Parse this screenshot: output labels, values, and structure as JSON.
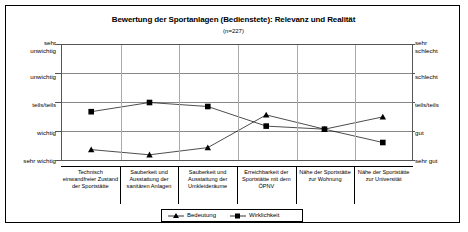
{
  "chart_data": {
    "type": "line",
    "title": "Bewertung der Sportanlagen (Bedienstete): Relevanz und Realität",
    "subtitle": "(n=227)",
    "categories": [
      "Technisch einwandfreier Zustand der Sportstätte",
      "Sauberkeit und Ausstattung der sanitären Anlagen",
      "Sauberkeit und Ausstattung der Umkleideräume",
      "Erreichbarkeit der Sportstätte mit dem ÖPNV",
      "Nähe der Sportstätte zur Wohnung",
      "Nähe der Sportstätte zur Universität"
    ],
    "categories_lines": [
      [
        "Technisch",
        "einwandfreier Zustand",
        "der Sportstätte"
      ],
      [
        "Sauberkeit und",
        "Ausstattung der",
        "sanitären Anlagen"
      ],
      [
        "Sauberkeit und",
        "Ausstattung der",
        "Umkleideräume"
      ],
      [
        "Erreichbarkeit der",
        "Sportstätte mit dem",
        "ÖPNV"
      ],
      [
        "Nähe der Sportstätte",
        "zur Wohnung"
      ],
      [
        "Nähe der Sportstätte",
        "zur Universität"
      ]
    ],
    "series": [
      {
        "name": "Bedeutung",
        "marker": "triangle",
        "values": [
          4.64,
          4.82,
          4.57,
          3.43,
          3.93,
          3.5
        ]
      },
      {
        "name": "Wirklichkeit",
        "marker": "square",
        "values": [
          3.32,
          3.0,
          3.14,
          3.82,
          3.93,
          4.39
        ]
      }
    ],
    "ylim": [
      1,
      5
    ],
    "grid": true,
    "legend_position": "bottom",
    "left_axis": {
      "label": "Relevanz",
      "ticks": [
        {
          "value": 1,
          "lines": [
            "sehr",
            "unwichtig"
          ]
        },
        {
          "value": 2,
          "lines": [
            "unwichtig"
          ]
        },
        {
          "value": 3,
          "lines": [
            "teils/teils"
          ]
        },
        {
          "value": 4,
          "lines": [
            "wichtig"
          ]
        },
        {
          "value": 5,
          "lines": [
            "sehr wichtig"
          ]
        }
      ]
    },
    "right_axis": {
      "label": "Realität",
      "ticks": [
        {
          "value": 1,
          "lines": [
            "sehr",
            "schlecht"
          ]
        },
        {
          "value": 2,
          "lines": [
            "schlecht"
          ]
        },
        {
          "value": 3,
          "lines": [
            "teils/teils"
          ]
        },
        {
          "value": 4,
          "lines": [
            "gut"
          ]
        },
        {
          "value": 5,
          "lines": [
            "sehr gut"
          ]
        }
      ]
    },
    "colors": {
      "series": "#000000",
      "grid": "#888888",
      "frame": "#000000"
    }
  },
  "legend": {
    "items": [
      {
        "label": "Bedeutung",
        "marker": "triangle"
      },
      {
        "label": "Wirklichkeit",
        "marker": "square"
      }
    ]
  },
  "axis_left": {
    "t1a": "sehr",
    "t1b": "unwichtig",
    "t2": "unwichtig",
    "t3": "teils/teils",
    "t4": "wichtig",
    "t5": "sehr wichtig"
  },
  "axis_right": {
    "t1a": "sehr",
    "t1b": "schlecht",
    "t2": "schlecht",
    "t3": "teils/teils",
    "t4": "gut",
    "t5": "sehr gut"
  }
}
